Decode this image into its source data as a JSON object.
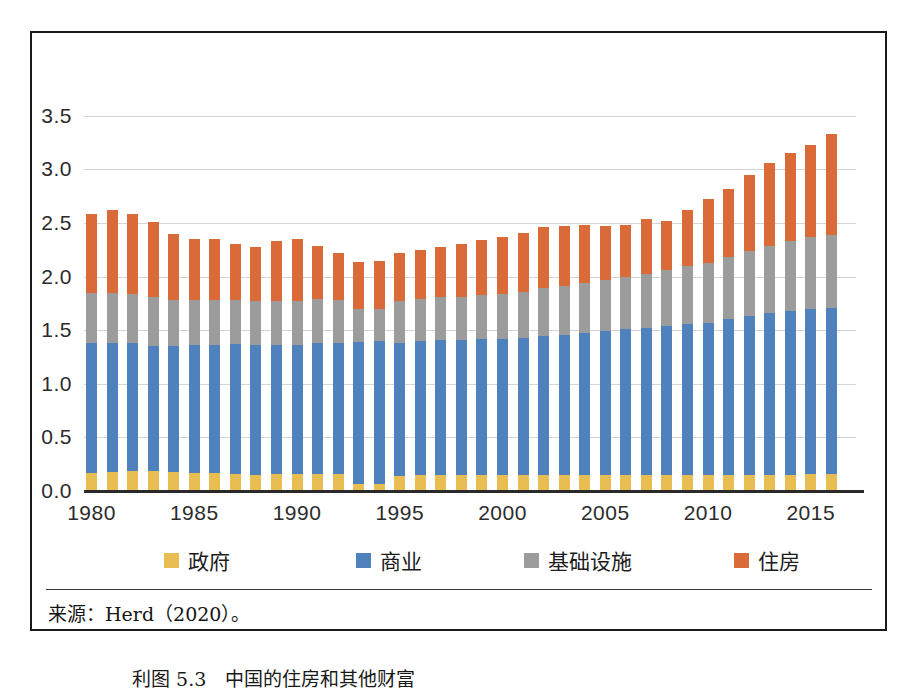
{
  "source_note": "来源：Herd（2020）。",
  "caption": "利图 5.3　中国的住房和其他财富",
  "legend": {
    "position": "bottom",
    "items": [
      {
        "label": "政府",
        "color": "#E8BE52",
        "key": "government"
      },
      {
        "label": "商业",
        "color": "#4F81BD",
        "key": "commercial"
      },
      {
        "label": "基础设施",
        "color": "#9C9C9C",
        "key": "infrastructure"
      },
      {
        "label": "住房",
        "color": "#DA6B38",
        "key": "housing"
      }
    ]
  },
  "chart_data": {
    "type": "bar",
    "stacked": true,
    "title": "",
    "subtitle": "",
    "xlabel": "",
    "ylabel": "",
    "ylim": [
      0.0,
      3.75
    ],
    "ytick_labels": [
      "0.0",
      "0.5",
      "1.0",
      "1.5",
      "2.0",
      "2.5",
      "3.0",
      "3.5"
    ],
    "ytick_values": [
      0.0,
      0.5,
      1.0,
      1.5,
      2.0,
      2.5,
      3.0,
      3.5
    ],
    "xtick_labels": [
      "1980",
      "1985",
      "1990",
      "1995",
      "2000",
      "2005",
      "2010",
      "2015"
    ],
    "xtick_values": [
      1980,
      1985,
      1990,
      1995,
      2000,
      2005,
      2010,
      2015
    ],
    "grid": "horizontal",
    "categories": [
      1980,
      1981,
      1982,
      1983,
      1984,
      1985,
      1986,
      1987,
      1988,
      1989,
      1990,
      1991,
      1992,
      1993,
      1994,
      1995,
      1996,
      1997,
      1998,
      1999,
      2000,
      2001,
      2002,
      2003,
      2004,
      2005,
      2006,
      2007,
      2008,
      2009,
      2010,
      2011,
      2012,
      2013,
      2014,
      2015,
      2016
    ],
    "series": [
      {
        "name": "政府",
        "key": "government",
        "color": "#E8BE52",
        "values": [
          0.17,
          0.18,
          0.19,
          0.19,
          0.18,
          0.17,
          0.17,
          0.16,
          0.15,
          0.16,
          0.16,
          0.16,
          0.16,
          0.07,
          0.07,
          0.14,
          0.15,
          0.15,
          0.15,
          0.15,
          0.15,
          0.15,
          0.15,
          0.15,
          0.15,
          0.15,
          0.15,
          0.15,
          0.15,
          0.15,
          0.15,
          0.15,
          0.15,
          0.15,
          0.15,
          0.16,
          0.16
        ]
      },
      {
        "name": "商业",
        "key": "commercial",
        "color": "#4F81BD",
        "values": [
          1.21,
          1.2,
          1.19,
          1.16,
          1.17,
          1.19,
          1.19,
          1.21,
          1.21,
          1.2,
          1.2,
          1.22,
          1.22,
          1.32,
          1.33,
          1.24,
          1.25,
          1.26,
          1.26,
          1.27,
          1.27,
          1.28,
          1.3,
          1.31,
          1.32,
          1.34,
          1.36,
          1.37,
          1.39,
          1.41,
          1.42,
          1.45,
          1.48,
          1.51,
          1.53,
          1.54,
          1.55
        ]
      },
      {
        "name": "基础设施",
        "key": "infrastructure",
        "color": "#9C9C9C",
        "values": [
          0.47,
          0.47,
          0.46,
          0.46,
          0.43,
          0.42,
          0.42,
          0.41,
          0.41,
          0.41,
          0.41,
          0.41,
          0.4,
          0.31,
          0.3,
          0.39,
          0.39,
          0.4,
          0.4,
          0.41,
          0.42,
          0.43,
          0.44,
          0.45,
          0.47,
          0.48,
          0.49,
          0.5,
          0.52,
          0.54,
          0.56,
          0.58,
          0.61,
          0.63,
          0.65,
          0.67,
          0.68
        ]
      },
      {
        "name": "住房",
        "key": "housing",
        "color": "#DA6B38",
        "values": [
          0.73,
          0.77,
          0.74,
          0.7,
          0.62,
          0.57,
          0.57,
          0.52,
          0.51,
          0.56,
          0.58,
          0.5,
          0.44,
          0.44,
          0.45,
          0.45,
          0.46,
          0.47,
          0.49,
          0.51,
          0.53,
          0.55,
          0.57,
          0.56,
          0.54,
          0.5,
          0.48,
          0.52,
          0.46,
          0.52,
          0.59,
          0.64,
          0.71,
          0.77,
          0.82,
          0.86,
          0.94
        ]
      }
    ],
    "totals": [
      2.58,
      2.62,
      2.58,
      2.51,
      2.4,
      2.35,
      2.35,
      2.3,
      2.28,
      2.33,
      2.35,
      2.29,
      2.22,
      2.14,
      2.15,
      2.22,
      2.25,
      2.28,
      2.3,
      2.34,
      2.37,
      2.41,
      2.46,
      2.47,
      2.48,
      2.47,
      2.48,
      2.54,
      2.52,
      2.62,
      2.72,
      2.82,
      2.95,
      3.06,
      3.15,
      3.23,
      3.33
    ]
  }
}
